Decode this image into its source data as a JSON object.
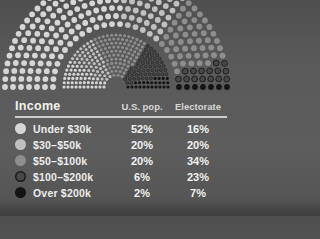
{
  "header": {
    "title": "Income",
    "col_us": "U.S. pop.",
    "col_electorate": "Electorate"
  },
  "table": {
    "rows": [
      {
        "label": "Under $30k",
        "us": "52%",
        "electorate": "16%"
      },
      {
        "label": "$30–$50k",
        "us": "20%",
        "electorate": "20%"
      },
      {
        "label": "$50–$100k",
        "us": "20%",
        "electorate": "34%"
      },
      {
        "label": "$100–$200k",
        "us": "6%",
        "electorate": "23%"
      },
      {
        "label": "Over $200k",
        "us": "2%",
        "electorate": "7%"
      }
    ]
  },
  "chart_data": {
    "type": "parliament-dot",
    "title": "Income",
    "categories": [
      "Under $30k",
      "$30–$50k",
      "$50–$100k",
      "$100–$200k",
      "Over $200k"
    ],
    "series": [
      {
        "name": "U.S. pop.",
        "ring": "outer",
        "values": [
          52,
          20,
          20,
          6,
          2
        ]
      },
      {
        "name": "Electorate",
        "ring": "inner",
        "values": [
          16,
          20,
          34,
          23,
          7
        ]
      }
    ],
    "unit": "%",
    "arc_degrees": 180,
    "legend_position": "table-below",
    "colors": [
      "#d6d6d6",
      "#c0c0c0",
      "#8e8e8e",
      "#484848",
      "#141414"
    ],
    "dot_outline_color": "#1d1d1d",
    "background": "#585858"
  }
}
